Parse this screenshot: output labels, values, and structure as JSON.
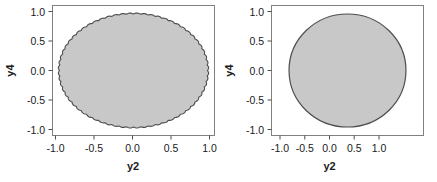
{
  "figure": {
    "background_color": "#ffffff",
    "panel_count": 2
  },
  "style": {
    "fill_color": "#c8c8c8",
    "edge_color": "#4d4d4d",
    "frame_color": "#808080",
    "text_color": "#1a1a1a"
  },
  "chart_data": [
    {
      "type": "scatter",
      "panel": "left",
      "title": "",
      "xlabel": "y2",
      "ylabel": "y4",
      "xlim": [
        -1.15,
        1.15
      ],
      "ylim": [
        -1.15,
        1.15
      ],
      "xticks": [
        -1.0,
        -0.5,
        0.0,
        0.5,
        1.0
      ],
      "xticklabels": [
        "-1.0",
        "-0.5",
        "0.0",
        "0.5",
        "1.0"
      ],
      "yticks": [
        -1.0,
        -0.5,
        0.0,
        0.5,
        1.0
      ],
      "yticklabels": [
        "-1.0",
        "-0.5",
        "0.0",
        "0.5",
        "1.0"
      ],
      "grid": false,
      "legend": null,
      "region": {
        "shape": "ellipse",
        "center": [
          0.0,
          0.0
        ],
        "semi_axis_x": 1.05,
        "semi_axis_y": 1.0,
        "fill": "#c8c8c8",
        "edge": "#4d4d4d",
        "edge_style": "scalloped",
        "scallop_count": 64,
        "scallop_amplitude": 0.018
      }
    },
    {
      "type": "scatter",
      "panel": "right",
      "title": "",
      "xlabel": "y2",
      "ylabel": "y4",
      "xlim": [
        -1.3,
        1.3
      ],
      "ylim": [
        -1.15,
        1.15
      ],
      "xticks": [
        -1.0,
        -0.5,
        0.0,
        0.5,
        1.0
      ],
      "xticklabels": [
        "-1.0",
        "-0.5",
        "0.0",
        "0.5",
        "1.0"
      ],
      "yticks": [
        -1.0,
        -0.5,
        0.0,
        0.5,
        1.0
      ],
      "yticklabels": [
        "-1.0",
        "-0.5",
        "0.0",
        "0.5",
        "1.0"
      ],
      "grid": false,
      "legend": null,
      "region": {
        "shape": "circle",
        "center": [
          0.0,
          0.0
        ],
        "radius": 1.0,
        "fill": "#c8c8c8",
        "edge": "#4d4d4d",
        "edge_style": "smooth"
      }
    }
  ],
  "panels": {
    "left": {
      "name": "left-plot",
      "xlabel": "y2",
      "ylabel": "y4",
      "xticklabels": [
        "-1.0",
        "-0.5",
        "0.0",
        "0.5",
        "1.0"
      ],
      "yticklabels": [
        "-1.0",
        "-0.5",
        "0.0",
        "0.5",
        "1.0"
      ]
    },
    "right": {
      "name": "right-plot",
      "xlabel": "y2",
      "ylabel": "y4",
      "xticklabels": [
        "-1.0",
        "-0.5",
        "0.0",
        "0.5",
        "1.0"
      ],
      "yticklabels": [
        "-1.0",
        "-0.5",
        "0.0",
        "0.5",
        "1.0"
      ]
    }
  }
}
